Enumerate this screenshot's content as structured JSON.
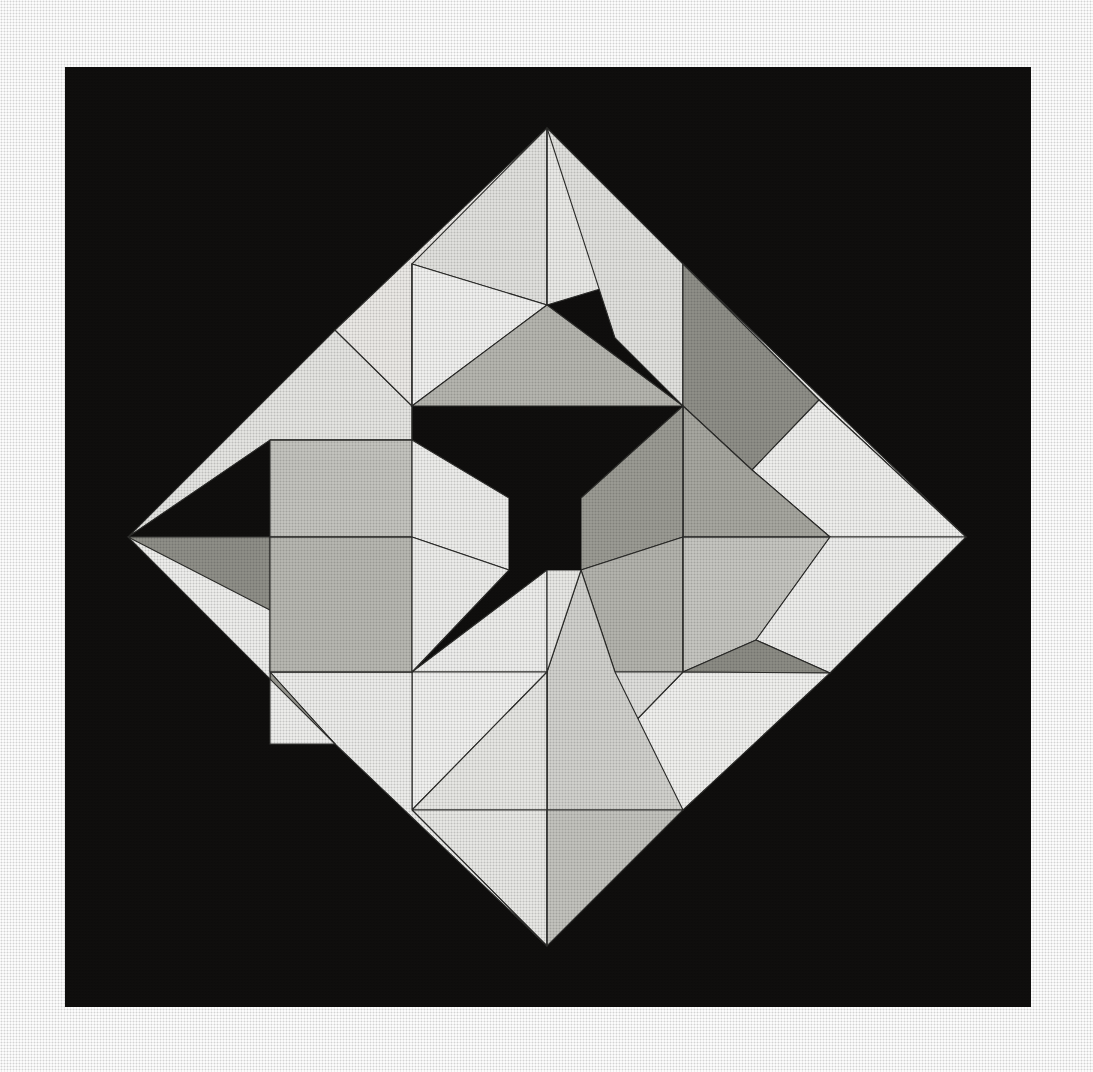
{
  "page": {
    "width": 1093,
    "height": 1072,
    "paper_color": "#ffffff"
  },
  "canvas": {
    "background_color": "#0d0c0b",
    "frame": {
      "x": 65,
      "y": 67,
      "width": 966,
      "height": 940
    }
  },
  "palette": {
    "black": "#0d0c0b",
    "white_paper": "#ffffff",
    "tone_1": "#f0f0ee",
    "tone_2": "#e6e6e3",
    "tone_3": "#dcdcd9",
    "tone_4": "#d2d2ce",
    "tone_5": "#c2c2bd",
    "tone_6": "#b2b2ac",
    "tone_7": "#a0a099",
    "tone_8": "#8e8e87",
    "tone_9": "#7d7d76",
    "stroke": "#2a2a28"
  },
  "composition": {
    "shape": "diamond",
    "center": {
      "x": 547,
      "y": 537
    },
    "half_diagonal": 419,
    "corners": [
      {
        "name": "top",
        "x": 547,
        "y": 128
      },
      {
        "name": "right",
        "x": 966,
        "y": 537
      },
      {
        "name": "bottom",
        "x": 547,
        "y": 946
      },
      {
        "name": "left",
        "x": 128,
        "y": 537
      }
    ],
    "center_hole": {
      "name": "center-void-square",
      "x": 509,
      "y": 498,
      "width": 72,
      "height": 72,
      "color": "#0d0c0b"
    },
    "stroke_width": 1.1,
    "quadrant_count": 4,
    "triangles_per_block": 8
  },
  "chart_data": {
    "type": "table",
    "columns": [
      "block",
      "facet",
      "tone"
    ],
    "rows": [
      [
        "north",
        "n-a",
        "tone_2"
      ],
      [
        "north",
        "n-b",
        "tone_3"
      ],
      [
        "north",
        "n-c",
        "tone_1"
      ],
      [
        "north",
        "n-d",
        "tone_6"
      ],
      [
        "east",
        "e-a",
        "tone_7"
      ],
      [
        "east",
        "e-b",
        "tone_2"
      ],
      [
        "east",
        "e-c",
        "tone_8"
      ],
      [
        "east",
        "e-d",
        "tone_4"
      ],
      [
        "south",
        "s-a",
        "tone_1"
      ],
      [
        "south",
        "s-b",
        "tone_5"
      ],
      [
        "south",
        "s-c",
        "tone_3"
      ],
      [
        "south",
        "s-d",
        "tone_6"
      ],
      [
        "west",
        "w-a",
        "tone_6"
      ],
      [
        "west",
        "w-b",
        "tone_2"
      ],
      [
        "west",
        "w-c",
        "tone_8"
      ],
      [
        "west",
        "w-d",
        "tone_3"
      ]
    ]
  },
  "facets": [
    {
      "id": "nw-outer-top-left",
      "points": "128,537 335,330 412,406 412,440 270,440",
      "fill": "#e6e6e3"
    },
    {
      "id": "nw-outer-top-right",
      "points": "335,330 547,128 547,264 412,264 412,406",
      "fill": "#eceae7"
    },
    {
      "id": "n-up-left",
      "points": "412,264 547,128 547,305",
      "fill": "#e2e2df"
    },
    {
      "id": "n-up-right",
      "points": "547,128 683,264 547,305",
      "fill": "#ebebe8"
    },
    {
      "id": "n-sq-left",
      "points": "412,264 547,305 412,406",
      "fill": "#f2f2f0"
    },
    {
      "id": "n-sq-bottom",
      "points": "412,406 547,305 683,406",
      "fill": "#b6b6b0"
    },
    {
      "id": "ne-roof-a",
      "points": "547,128 683,264 683,406 615,338",
      "fill": "#e2e2df"
    },
    {
      "id": "ne-roof-b",
      "points": "683,264 819,400 683,406",
      "fill": "#d6d6d2"
    },
    {
      "id": "ne-wedge-dark",
      "points": "683,406 683,264 819,400 752,470",
      "fill": "#8f8f88"
    },
    {
      "id": "ne-right-pale",
      "points": "819,400 966,537 830,537 752,470",
      "fill": "#f0f0ee"
    },
    {
      "id": "ne-outer-top",
      "points": "683,264 966,537 819,400",
      "fill": "#eeeeec"
    },
    {
      "id": "e-sq-top",
      "points": "683,406 752,470 830,537 683,537",
      "fill": "#a7a7a0"
    },
    {
      "id": "e-sq-left",
      "points": "581,498 683,406 683,537 581,570",
      "fill": "#9b9b94"
    },
    {
      "id": "e-sq-bottom",
      "points": "581,570 683,537 683,672 615,672",
      "fill": "#b4b4ae"
    },
    {
      "id": "e-sq-right",
      "points": "683,537 830,537 756,640 683,672",
      "fill": "#c6c6c1"
    },
    {
      "id": "e-outer-right-upper",
      "points": "830,537 966,537 830,673 756,640",
      "fill": "#efefed"
    },
    {
      "id": "e-outer-right-lower",
      "points": "756,640 830,673 683,672",
      "fill": "#8c8c85"
    },
    {
      "id": "se-pale-big",
      "points": "683,672 830,673 683,810 615,742",
      "fill": "#f1f1ef"
    },
    {
      "id": "se-mid",
      "points": "615,672 683,672 615,742",
      "fill": "#e0e0dd"
    },
    {
      "id": "s-sq-right",
      "points": "581,570 615,672 683,810 547,810 547,672",
      "fill": "#d2d2ce"
    },
    {
      "id": "s-up-left",
      "points": "412,672 547,570 547,672",
      "fill": "#efefed"
    },
    {
      "id": "s-up-right",
      "points": "547,570 581,570 547,672",
      "fill": "#e9e9e6"
    },
    {
      "id": "s-sq-left",
      "points": "412,672 547,672 412,810",
      "fill": "#f2f2f0"
    },
    {
      "id": "s-sq-low",
      "points": "412,810 547,672 547,810",
      "fill": "#e8e8e5"
    },
    {
      "id": "s-bot-left",
      "points": "412,810 547,810 547,946",
      "fill": "#e9e9e6"
    },
    {
      "id": "s-bot-right",
      "points": "547,810 683,810 547,946",
      "fill": "#c3c3be"
    },
    {
      "id": "sw-outer-low",
      "points": "270,672 412,672 412,810 547,946 335,744",
      "fill": "#eeeeec"
    },
    {
      "id": "sw-dark-wedge",
      "points": "270,672 335,744 270,744",
      "fill": "#9a9a93"
    },
    {
      "id": "sw-outer-left",
      "points": "128,537 270,537 270,744 335,744",
      "fill": "#efefed"
    },
    {
      "id": "w-dark-band",
      "points": "128,537 270,537 270,610",
      "fill": "#8f8f88"
    },
    {
      "id": "w-sq-top",
      "points": "270,440 412,440 412,537 270,537",
      "fill": "#c4c4bf"
    },
    {
      "id": "w-sq-bottom",
      "points": "270,537 412,537 412,672 270,672",
      "fill": "#b8b8b2"
    },
    {
      "id": "w-mid-pale",
      "points": "412,440 509,498 509,570 412,537",
      "fill": "#eeeeec"
    },
    {
      "id": "w-mid-low",
      "points": "412,537 509,570 412,672",
      "fill": "#eeeeec"
    }
  ]
}
